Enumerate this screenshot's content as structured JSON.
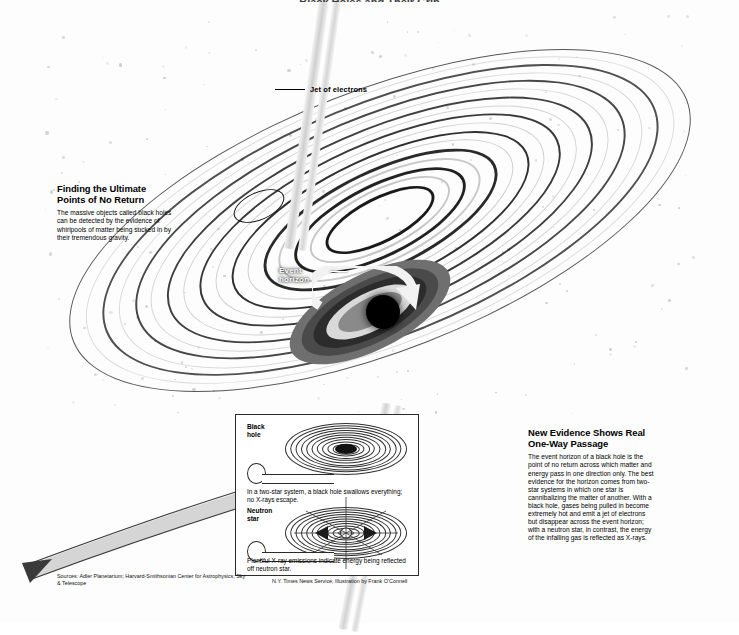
{
  "figure": {
    "top_title": "Black Holes and Their Grip",
    "jet_label": "Jet of electrons",
    "event_horizon_label": "Event\nhorizon"
  },
  "left_block": {
    "title": "Finding the Ultimate Points of No Return",
    "body": "The massive objects called black holes can be detected by the evidence of whirlpools of matter being sucked in by their tremendous gravity."
  },
  "right_block": {
    "title": "New Evidence Shows Real One-Way Passage",
    "body": "The event horizon of a black hole is the point of no return across which matter and energy pass in one direction only. The best evidence for the horizon comes from two-star systems in which one star is cannibalizing the matter of another. With a black hole, gases being pulled in become extremely hot and emit a jet of electrons but disappear across the event horizon; with a neutron star, in contrast, the energy of the infalling gas is reflected as X-rays."
  },
  "inset": {
    "panel_1": {
      "label": "Black hole",
      "caption": "In a two-star system, a black hole swallows everything; no X-rays escape."
    },
    "panel_2": {
      "label": "Neutron star",
      "caption": "Plentiful X-ray emissions indicate energy being reflected off neutron star."
    }
  },
  "credits": {
    "sources": "Sources: Adler Planetarium; Harvard-Smithsonian Center for Astrophysics; Sky & Telescope",
    "byline": "N.Y. Times News Service; Illustration by Frank O’Connell"
  },
  "colors": {
    "ink": "#000000",
    "paper": "#ffffff",
    "disk_dark": "#111111",
    "disk_mid": "#777777",
    "label_white": "#ffffff"
  }
}
